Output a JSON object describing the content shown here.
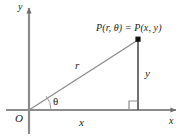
{
  "figure": {
    "type": "diagram",
    "colors": {
      "background": "#ffffff",
      "axis": "#8c8c8c",
      "ray": "#8c8c8c",
      "leg": "#4d4d4d",
      "text": "#1a1a1a",
      "point": "#111111"
    },
    "labels": {
      "axis_y": "y",
      "axis_x": "x",
      "origin": "O",
      "radius": "r",
      "angle": "θ",
      "leg_vertical": "y",
      "leg_horizontal": "x",
      "point": "P(r, θ) = P(x, y)"
    },
    "geometry": {
      "origin_px": [
        29,
        110
      ],
      "point_px": [
        138,
        40
      ],
      "x_axis_end_px": [
        178,
        110
      ],
      "y_axis_top_px": [
        29,
        6
      ],
      "right_angle_marker_px": [
        138,
        110
      ],
      "angle_arc_radius_px": 22
    }
  }
}
